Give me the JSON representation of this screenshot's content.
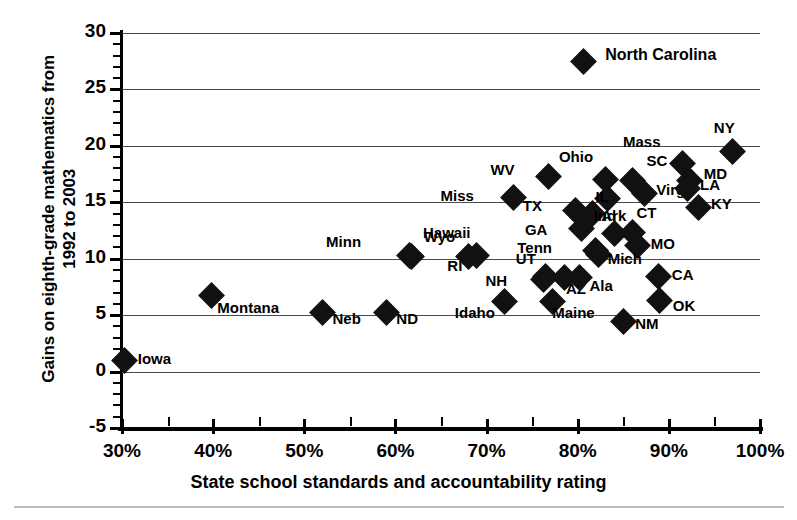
{
  "chart_data": {
    "type": "scatter",
    "title": "",
    "xlabel": "State school standards and accountability rating",
    "ylabel": "Gains on eighth-grade mathematics from\n1992 to 2003",
    "xlim": [
      30,
      100
    ],
    "ylim": [
      -5,
      30
    ],
    "xticks": [
      "30%",
      "40%",
      "50%",
      "60%",
      "70%",
      "80%",
      "90%",
      "100%"
    ],
    "xtick_values": [
      30,
      40,
      50,
      60,
      70,
      80,
      90,
      100
    ],
    "yticks": [
      "30",
      "25",
      "20",
      "15",
      "10",
      "5",
      "0",
      "-5"
    ],
    "ytick_values": [
      30,
      25,
      20,
      15,
      10,
      5,
      0,
      -5
    ],
    "grid": "horizontal",
    "legend": "none",
    "marker": "diamond",
    "marker_color": "#111111",
    "points": [
      {
        "label": "North Carolina",
        "x": 80.6,
        "y": 27.5,
        "lx": 22,
        "ly": -8,
        "cls": "lg"
      },
      {
        "label": "NY",
        "x": 97.0,
        "y": 19.5,
        "lx": -2,
        "ly": -26
      },
      {
        "label": "Mass",
        "x": 91.5,
        "y": 18.4,
        "lx": -26,
        "ly": -24
      },
      {
        "label": "MD",
        "x": 92.3,
        "y": 16.9,
        "lx": 14,
        "ly": -9
      },
      {
        "label": "WV",
        "x": 76.8,
        "y": 17.3,
        "lx": -38,
        "ly": -8
      },
      {
        "label": "Ohio",
        "x": 83.0,
        "y": 17.0,
        "lx": -16,
        "ly": -25
      },
      {
        "label": "SC",
        "x": 86.0,
        "y": 16.9,
        "lx": 14,
        "ly": -22
      },
      {
        "label": "Virg",
        "x": 87.3,
        "y": 15.8,
        "lx": 12,
        "ly": -5
      },
      {
        "label": "LA",
        "x": 92.0,
        "y": 16.2,
        "lx": 13,
        "ly": -6
      },
      {
        "label": "KY",
        "x": 93.2,
        "y": 14.5,
        "lx": 13,
        "ly": -6
      },
      {
        "label": "IL",
        "x": 83.3,
        "y": 15.3,
        "lx": -3,
        "ly": -4
      },
      {
        "label": "Miss",
        "x": 73.0,
        "y": 15.4,
        "lx": -44,
        "ly": -4
      },
      {
        "label": "TX",
        "x": 79.8,
        "y": 14.3,
        "lx": -38,
        "ly": -6
      },
      {
        "label": "Ark",
        "x": 81.6,
        "y": 14.0,
        "lx": 9,
        "ly": 0
      },
      {
        "label": "GA",
        "x": 80.4,
        "y": 12.7,
        "lx": -38,
        "ly": 0
      },
      {
        "label": "Ind",
        "x": 84.0,
        "y": 12.2,
        "lx": -2,
        "ly": -20
      },
      {
        "label": "CT",
        "x": 86.0,
        "y": 12.3,
        "lx": 4,
        "ly": -22
      },
      {
        "label": "MO",
        "x": 86.6,
        "y": 11.2,
        "lx": 13,
        "ly": -3
      },
      {
        "label": "Tenn",
        "x": 82.0,
        "y": 10.7,
        "lx": -48,
        "ly": -5
      },
      {
        "label": "Mich",
        "x": 82.3,
        "y": 10.4,
        "lx": 9,
        "ly": 3
      },
      {
        "label": "Hawaii",
        "x": 68.9,
        "y": 10.3,
        "lx": -10,
        "ly": -24
      },
      {
        "label": "RI",
        "x": 68.0,
        "y": 10.2,
        "lx": -10,
        "ly": 8
      },
      {
        "label": "Wyo",
        "x": 61.8,
        "y": 10.2,
        "lx": 12,
        "ly": -21
      },
      {
        "label": "Minn",
        "x": 61.5,
        "y": 10.3,
        "lx": -52,
        "ly": -15
      },
      {
        "label": "UT",
        "x": 76.5,
        "y": 8.4,
        "lx": -14,
        "ly": -20
      },
      {
        "label": "NH",
        "x": 76.2,
        "y": 8.2,
        "lx": -40,
        "ly": 0
      },
      {
        "label": "AZ",
        "x": 78.5,
        "y": 8.3,
        "lx": 2,
        "ly": 9
      },
      {
        "label": "Ala",
        "x": 80.2,
        "y": 8.3,
        "lx": 10,
        "ly": 6
      },
      {
        "label": "CA",
        "x": 88.9,
        "y": 8.4,
        "lx": 13,
        "ly": -4
      },
      {
        "label": "Montana",
        "x": 39.8,
        "y": 6.7,
        "lx": 6,
        "ly": 10
      },
      {
        "label": "OK",
        "x": 89.0,
        "y": 6.3,
        "lx": 13,
        "ly": 4
      },
      {
        "label": "Idaho",
        "x": 72.0,
        "y": 6.2,
        "lx": -14,
        "ly": 9
      },
      {
        "label": "Maine",
        "x": 77.2,
        "y": 6.2,
        "lx": 0,
        "ly": 9
      },
      {
        "label": "Neb",
        "x": 52.0,
        "y": 5.2,
        "lx": 10,
        "ly": 4
      },
      {
        "label": "ND",
        "x": 59.0,
        "y": 5.2,
        "lx": 10,
        "ly": 4
      },
      {
        "label": "NM",
        "x": 85.0,
        "y": 4.4,
        "lx": 12,
        "ly": 0
      },
      {
        "label": "Iowa",
        "x": 30.3,
        "y": 1.0,
        "lx": 13,
        "ly": -3
      }
    ]
  },
  "axis": {
    "xlabel": "State school standards and accountability rating",
    "ylabel_line1": "Gains on eighth-grade mathematics from",
    "ylabel_line2": "1992 to 2003"
  }
}
